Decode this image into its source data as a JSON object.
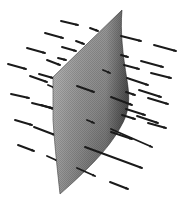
{
  "figure": {
    "width": 187,
    "height": 202,
    "colors": {
      "background": "#ffffff",
      "arrow": "#1a1a1a",
      "surface_light": "#b5b5b5",
      "surface_mid": "#8a8a8a",
      "surface_dark": "#4a4a4a"
    },
    "surface": {
      "name": "curved-surface",
      "path": "M122,10 L53,77 L53,120 C55,150 58,175 60,194 C85,172 108,150 120,128 C130,112 130,98 127,80 C123,55 120,32 122,10 Z"
    },
    "arrows_behind": [
      {
        "x1": 61,
        "y1": 21,
        "x2": 78,
        "y2": 25
      },
      {
        "x1": 45,
        "y1": 33,
        "x2": 63,
        "y2": 38
      },
      {
        "x1": 90,
        "y1": 28,
        "x2": 98,
        "y2": 31
      },
      {
        "x1": 27,
        "y1": 48,
        "x2": 45,
        "y2": 53
      },
      {
        "x1": 62,
        "y1": 47,
        "x2": 76,
        "y2": 51
      },
      {
        "x1": 76,
        "y1": 41,
        "x2": 84,
        "y2": 44
      },
      {
        "x1": 47,
        "y1": 60,
        "x2": 60,
        "y2": 65
      },
      {
        "x1": 58,
        "y1": 58,
        "x2": 66,
        "y2": 60
      },
      {
        "x1": 8,
        "y1": 64,
        "x2": 26,
        "y2": 69
      },
      {
        "x1": 39,
        "y1": 74,
        "x2": 53,
        "y2": 78
      },
      {
        "x1": 30,
        "y1": 76,
        "x2": 47,
        "y2": 82
      },
      {
        "x1": 48,
        "y1": 85,
        "x2": 55,
        "y2": 88
      },
      {
        "x1": 11,
        "y1": 94,
        "x2": 29,
        "y2": 98
      },
      {
        "x1": 32,
        "y1": 103,
        "x2": 52,
        "y2": 108
      },
      {
        "x1": 41,
        "y1": 105,
        "x2": 54,
        "y2": 109
      },
      {
        "x1": 15,
        "y1": 120,
        "x2": 32,
        "y2": 125
      },
      {
        "x1": 34,
        "y1": 127,
        "x2": 55,
        "y2": 135
      },
      {
        "x1": 18,
        "y1": 145,
        "x2": 34,
        "y2": 151
      },
      {
        "x1": 47,
        "y1": 156,
        "x2": 58,
        "y2": 161
      }
    ],
    "arrows_front": [
      {
        "x1": 121,
        "y1": 36,
        "x2": 141,
        "y2": 41
      },
      {
        "x1": 154,
        "y1": 45,
        "x2": 176,
        "y2": 51
      },
      {
        "x1": 121,
        "y1": 55,
        "x2": 128,
        "y2": 57
      },
      {
        "x1": 124,
        "y1": 65,
        "x2": 139,
        "y2": 69
      },
      {
        "x1": 141,
        "y1": 61,
        "x2": 163,
        "y2": 67
      },
      {
        "x1": 103,
        "y1": 70,
        "x2": 110,
        "y2": 73
      },
      {
        "x1": 151,
        "y1": 73,
        "x2": 171,
        "y2": 78
      },
      {
        "x1": 127,
        "y1": 78,
        "x2": 148,
        "y2": 85
      },
      {
        "x1": 77,
        "y1": 86,
        "x2": 94,
        "y2": 92
      },
      {
        "x1": 139,
        "y1": 90,
        "x2": 161,
        "y2": 97
      },
      {
        "x1": 126,
        "y1": 92,
        "x2": 135,
        "y2": 95
      },
      {
        "x1": 111,
        "y1": 97,
        "x2": 132,
        "y2": 105
      },
      {
        "x1": 148,
        "y1": 98,
        "x2": 168,
        "y2": 104
      },
      {
        "x1": 126,
        "y1": 109,
        "x2": 145,
        "y2": 115
      },
      {
        "x1": 122,
        "y1": 115,
        "x2": 135,
        "y2": 119
      },
      {
        "x1": 137,
        "y1": 116,
        "x2": 158,
        "y2": 123
      },
      {
        "x1": 87,
        "y1": 120,
        "x2": 94,
        "y2": 123
      },
      {
        "x1": 148,
        "y1": 123,
        "x2": 166,
        "y2": 128
      },
      {
        "x1": 111,
        "y1": 129,
        "x2": 152,
        "y2": 147
      },
      {
        "x1": 111,
        "y1": 132,
        "x2": 132,
        "y2": 139
      },
      {
        "x1": 85,
        "y1": 147,
        "x2": 142,
        "y2": 168
      },
      {
        "x1": 77,
        "y1": 168,
        "x2": 95,
        "y2": 176
      },
      {
        "x1": 110,
        "y1": 182,
        "x2": 128,
        "y2": 189
      }
    ]
  }
}
